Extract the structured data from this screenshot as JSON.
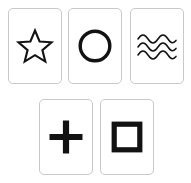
{
  "image": {
    "title": "Zener ESP card set",
    "background_color": "#ffffff",
    "width": 191,
    "height": 183
  },
  "card_style": {
    "fill_color": "#ffffff",
    "border_color": "#c9c9c9",
    "symbol_color": "#121212",
    "corner_radius": "5px",
    "card_width": 54,
    "card_height": 76
  },
  "rows": [
    {
      "name": "top-row",
      "cards": [
        {
          "id": "card-star",
          "symbol": "star-icon",
          "symbol_label": "Star",
          "points": 5,
          "position": {
            "x": 8,
            "y": 8
          }
        },
        {
          "id": "card-circle",
          "symbol": "circle-icon",
          "symbol_label": "Circle",
          "position": {
            "x": 68,
            "y": 8
          }
        },
        {
          "id": "card-waves",
          "symbol": "waves-icon",
          "symbol_label": "Waves",
          "line_count": 3,
          "position": {
            "x": 130,
            "y": 8
          }
        }
      ]
    },
    {
      "name": "bottom-row",
      "cards": [
        {
          "id": "card-cross",
          "symbol": "cross-icon",
          "symbol_label": "Cross",
          "position": {
            "x": 39,
            "y": 99
          }
        },
        {
          "id": "card-square",
          "symbol": "square-icon",
          "symbol_label": "Square",
          "position": {
            "x": 100,
            "y": 99
          }
        }
      ]
    }
  ]
}
